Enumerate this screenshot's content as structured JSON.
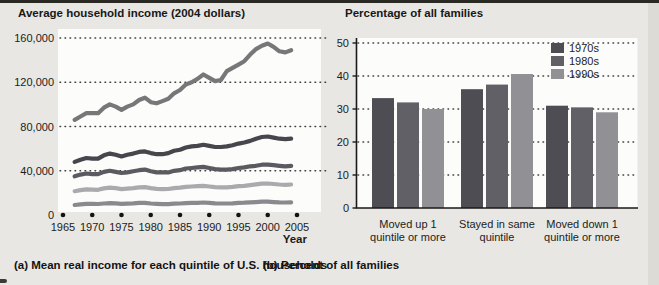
{
  "figure": {
    "bg_color": "#e8e7e3",
    "plot_bg_color": "#fcfcfa",
    "grid_dot_color": "#3f3f3f",
    "axis_color": "#1a1a1a",
    "text_color": "#1c1c1c"
  },
  "chart_data": [
    {
      "type": "line",
      "title": "Average household income (2004 dollars)",
      "caption": "(a) Mean real income for each quintile of U.S. households",
      "xlabel": "Year",
      "ylabel": "",
      "grid": "dotted-horizontal",
      "ylim": [
        0,
        160000
      ],
      "x_ticks": [
        "1965",
        "1970",
        "1975",
        "1980",
        "1985",
        "1990",
        "1995",
        "2000",
        "2005"
      ],
      "y_ticks": [
        {
          "value": 0,
          "label": "0"
        },
        {
          "value": 40000,
          "label": "40,000"
        },
        {
          "value": 80000,
          "label": "80,000"
        },
        {
          "value": 120000,
          "label": "120,000"
        },
        {
          "value": 160000,
          "label": "160,000"
        }
      ],
      "years": [
        1967,
        1968,
        1969,
        1970,
        1971,
        1972,
        1973,
        1974,
        1975,
        1976,
        1977,
        1978,
        1979,
        1980,
        1981,
        1982,
        1983,
        1984,
        1985,
        1986,
        1987,
        1988,
        1989,
        1990,
        1991,
        1992,
        1993,
        1994,
        1995,
        1996,
        1997,
        1998,
        1999,
        2000,
        2001,
        2002,
        2003,
        2004
      ],
      "series": [
        {
          "name": "Highest quintile",
          "color": "#77777a",
          "values": [
            86000,
            89000,
            92000,
            92000,
            92000,
            97000,
            100000,
            98000,
            95000,
            98000,
            100000,
            104000,
            106000,
            102000,
            101000,
            103000,
            105000,
            110000,
            113000,
            118000,
            120000,
            123000,
            127000,
            124000,
            121000,
            122000,
            130000,
            133000,
            136000,
            139000,
            145000,
            150000,
            153000,
            155000,
            152000,
            148000,
            147000,
            149000
          ]
        },
        {
          "name": "Fourth quintile",
          "color": "#46464c",
          "values": [
            48000,
            50000,
            51500,
            51000,
            51000,
            54000,
            55500,
            54500,
            53000,
            54500,
            55500,
            57000,
            57500,
            56000,
            55000,
            55000,
            56000,
            58000,
            59000,
            61000,
            62000,
            62500,
            63500,
            62500,
            61500,
            61500,
            62000,
            63000,
            64500,
            65500,
            67000,
            69000,
            70500,
            71000,
            70000,
            69000,
            68500,
            69000
          ]
        },
        {
          "name": "Middle quintile",
          "color": "#5a5a60",
          "values": [
            35000,
            36500,
            37500,
            37000,
            37000,
            39000,
            40000,
            39000,
            38000,
            38500,
            39500,
            40500,
            41000,
            39500,
            38500,
            38500,
            38500,
            40000,
            40500,
            42000,
            42500,
            43000,
            43500,
            42500,
            41500,
            41000,
            41000,
            41500,
            42500,
            43000,
            44000,
            44500,
            45500,
            45500,
            45000,
            44500,
            44000,
            44500
          ]
        },
        {
          "name": "Second quintile",
          "color": "#aaaaae",
          "values": [
            21500,
            22500,
            23200,
            23000,
            22800,
            24000,
            24700,
            24200,
            23400,
            23900,
            24300,
            25000,
            25200,
            24300,
            23700,
            23400,
            23500,
            24300,
            24700,
            25500,
            25800,
            26000,
            26400,
            25800,
            25200,
            25000,
            25000,
            25400,
            26000,
            26400,
            27000,
            27700,
            28300,
            28500,
            28000,
            27600,
            27300,
            27600
          ]
        },
        {
          "name": "Lowest quintile",
          "color": "#8a8a8e",
          "values": [
            9000,
            9600,
            10100,
            10000,
            9900,
            10400,
            10700,
            10500,
            10100,
            10300,
            10500,
            10900,
            11000,
            10400,
            10000,
            9800,
            9800,
            10200,
            10400,
            10800,
            10900,
            11000,
            11300,
            11000,
            10600,
            10400,
            10400,
            10600,
            11000,
            11100,
            11400,
            11700,
            12000,
            12000,
            11700,
            11400,
            11300,
            11400
          ]
        }
      ]
    },
    {
      "type": "bar",
      "title": "Percentage of all families",
      "caption": "(b) Percent of all families",
      "grid": "dotted-horizontal",
      "ylim": [
        0,
        50
      ],
      "y_ticks": [
        0,
        10,
        20,
        30,
        40,
        50
      ],
      "legend_position": "top-right",
      "categories": [
        [
          "Moved up 1",
          "quintile or more"
        ],
        [
          "Stayed in same",
          "quintile"
        ],
        [
          "Moved down 1",
          "quintile or more"
        ]
      ],
      "series": [
        {
          "name": "1970s",
          "color": "#4d4d53",
          "values": [
            33.3,
            36.0,
            31.0
          ]
        },
        {
          "name": "1980s",
          "color": "#606066",
          "values": [
            32.0,
            37.4,
            30.5
          ]
        },
        {
          "name": "1990s",
          "color": "#909095",
          "values": [
            30.0,
            40.6,
            29.0
          ]
        }
      ]
    }
  ]
}
